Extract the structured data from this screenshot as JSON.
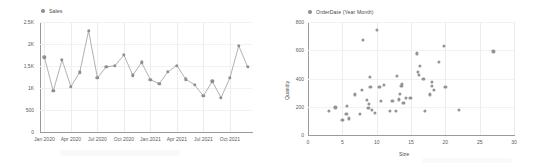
{
  "chart_data": [
    {
      "type": "line",
      "title": "",
      "legend": [
        {
          "label": "Sales",
          "color": "#8f8f8f",
          "marker": "circle"
        }
      ],
      "legend_position": "top-left",
      "grid": true,
      "xlabel": "",
      "ylabel": "",
      "categories": [
        "Jan 2020",
        "Feb 2020",
        "Mar 2020",
        "Apr 2020",
        "May 2020",
        "Jun 2020",
        "Jul 2020",
        "Aug 2020",
        "Sep 2020",
        "Oct 2020",
        "Nov 2020",
        "Dec 2020",
        "Jan 2021",
        "Feb 2021",
        "Mar 2021",
        "Apr 2021",
        "May 2021",
        "Jun 2021",
        "Jul 2021",
        "Aug 2021",
        "Sep 2021",
        "Oct 2021",
        "Nov 2021",
        "Dec 2021"
      ],
      "xticklabels": [
        "Jan 2020",
        "Apr 2020",
        "Jul 2020",
        "Oct 2020",
        "Jan 2021",
        "Apr 2021",
        "Jul 2021",
        "Oct 2021"
      ],
      "xtick_indices": [
        0,
        3,
        6,
        9,
        12,
        15,
        18,
        21
      ],
      "yticklabels": [
        "0",
        "500",
        "1K",
        "1.5K",
        "2K",
        "2.5K"
      ],
      "ytickvalues": [
        0,
        500,
        1000,
        1500,
        2000,
        2500
      ],
      "ylim": [
        0,
        2500
      ],
      "values": [
        1700,
        930,
        1640,
        1030,
        1360,
        2300,
        1230,
        1480,
        1510,
        1750,
        1290,
        1580,
        1190,
        1100,
        1370,
        1510,
        1200,
        1070,
        820,
        1150,
        780,
        1230,
        1960,
        1480
      ]
    },
    {
      "type": "scatter",
      "title": "",
      "legend": [
        {
          "label": "OrderDate (Year Month)",
          "color": "#949494",
          "marker": "circle"
        }
      ],
      "legend_position": "top-left",
      "grid": true,
      "xlabel": "Size",
      "ylabel": "Quantity",
      "xticklabels": [
        "0",
        "5",
        "10",
        "15",
        "20",
        "25",
        "30"
      ],
      "xtickvalues": [
        0,
        5,
        10,
        15,
        20,
        25,
        30
      ],
      "yticklabels": [
        "0",
        "200",
        "400",
        "600",
        "800"
      ],
      "ytickvalues": [
        0,
        200,
        400,
        600,
        800
      ],
      "xlim": [
        0,
        30
      ],
      "ylim": [
        0,
        800
      ],
      "points": [
        [
          3,
          170
        ],
        [
          4,
          195
        ],
        [
          5,
          105
        ],
        [
          5.6,
          150
        ],
        [
          5.7,
          205
        ],
        [
          5.9,
          118
        ],
        [
          6.8,
          288
        ],
        [
          7.6,
          148
        ],
        [
          7.8,
          318
        ],
        [
          8,
          672
        ],
        [
          8.6,
          250
        ],
        [
          8.8,
          192
        ],
        [
          8.9,
          222
        ],
        [
          9,
          410
        ],
        [
          9.1,
          340
        ],
        [
          9.3,
          178
        ],
        [
          9.7,
          155
        ],
        [
          10,
          745
        ],
        [
          10.4,
          340
        ],
        [
          10.6,
          240
        ],
        [
          11,
          355
        ],
        [
          11.9,
          168
        ],
        [
          12.3,
          240
        ],
        [
          12.8,
          168
        ],
        [
          13,
          418
        ],
        [
          13.2,
          252
        ],
        [
          13.4,
          290
        ],
        [
          13.6,
          345
        ],
        [
          13.7,
          362
        ],
        [
          13.9,
          228
        ],
        [
          14.3,
          265
        ],
        [
          14.9,
          262
        ],
        [
          15.9,
          578
        ],
        [
          16,
          445
        ],
        [
          16.1,
          425
        ],
        [
          16.3,
          490
        ],
        [
          16.8,
          400
        ],
        [
          17,
          168
        ],
        [
          17.8,
          288
        ],
        [
          18,
          345
        ],
        [
          18.1,
          378
        ],
        [
          18.3,
          318
        ],
        [
          19.1,
          518
        ],
        [
          19.8,
          632
        ],
        [
          20,
          340
        ],
        [
          22,
          180
        ],
        [
          27,
          592
        ]
      ]
    }
  ]
}
